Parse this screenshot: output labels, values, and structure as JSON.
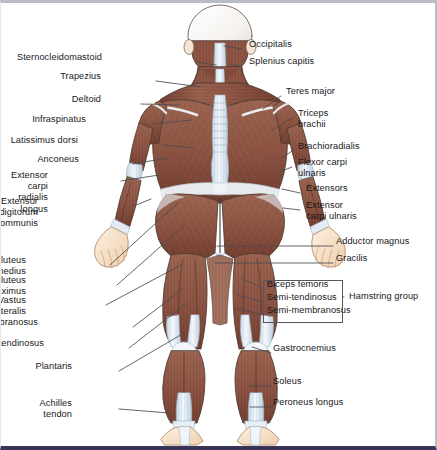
{
  "figure": {
    "view": "posterior",
    "colors": {
      "muscle": "#8b5242",
      "muscle_dark": "#6d3a2d",
      "muscle_light": "#a9705c",
      "tendon": "#dfe9f2",
      "tendon_edge": "#9fb3c6",
      "skin": "#f6ddc3",
      "skin_edge": "#c9a684",
      "skull": "#f7f5f3",
      "outline": "#4a3b33",
      "leader": "#4a4a52",
      "background": "#ffffff",
      "border_top": "#b9bcc6",
      "border_bottom": "#3a3358",
      "text": "#17171a"
    }
  },
  "labels_left": [
    {
      "id": "sternocleidomastoid",
      "text": "Sternocleidomastoid",
      "x": 104,
      "y": 55,
      "lx": 196,
      "ly": 59,
      "tx": 215,
      "ty": 62
    },
    {
      "id": "trapezius",
      "text": "Trapezius",
      "x": 103,
      "y": 74,
      "lx": 155,
      "ly": 78,
      "tx": 200,
      "ty": 84
    },
    {
      "id": "deltoid",
      "text": "Deltoid",
      "x": 103,
      "y": 97,
      "lx": 140,
      "ly": 101,
      "tx": 179,
      "ty": 102
    },
    {
      "id": "infraspinatus",
      "text": "Infraspinatus",
      "x": 88,
      "y": 117,
      "lx": 153,
      "ly": 121,
      "tx": 190,
      "ty": 117
    },
    {
      "id": "latissimus-dorsi",
      "text": "Latissimus dorsi",
      "x": 80,
      "y": 138,
      "lx": 162,
      "ly": 142,
      "tx": 192,
      "ty": 145
    },
    {
      "id": "anconeus",
      "text": "Anconeus",
      "x": 81,
      "y": 157,
      "lx": 132,
      "ly": 161,
      "tx": 166,
      "ty": 155
    },
    {
      "id": "extensor-carpi-radialis-longus",
      "text": "Extensor carpi\nradialis longus",
      "x": 50,
      "y": 173,
      "lx": 120,
      "ly": 178,
      "tx": 158,
      "ty": 172
    },
    {
      "id": "extensor-digitorum-communis",
      "text": "Extensor digitorum\ncommunis",
      "x": 40,
      "y": 199,
      "lx": 133,
      "ly": 203,
      "tx": 150,
      "ty": 196
    },
    {
      "id": "gluteus-medius",
      "text": "Gluteus medius",
      "x": 28,
      "y": 258,
      "lx": 109,
      "ly": 262,
      "tx": 178,
      "ty": 199
    },
    {
      "id": "gluteus-maximus",
      "text": "Gluteus maximus",
      "x": 28,
      "y": 278,
      "lx": 116,
      "ly": 282,
      "tx": 184,
      "ty": 222
    },
    {
      "id": "vastus-lateralis",
      "text": "Vastus lateralis",
      "x": 28,
      "y": 298,
      "lx": 105,
      "ly": 302,
      "tx": 180,
      "ty": 262
    },
    {
      "id": "semimembranosus",
      "text": "Semimembranosus",
      "x": 40,
      "y": 320,
      "lx": 132,
      "ly": 324,
      "tx": 182,
      "ty": 286
    },
    {
      "id": "semitendinosus",
      "text": "Semitendinosus",
      "x": 46,
      "y": 341,
      "lx": 128,
      "ly": 345,
      "tx": 186,
      "ty": 300
    },
    {
      "id": "plantaris",
      "text": "Plantaris",
      "x": 74,
      "y": 364,
      "lx": 118,
      "ly": 368,
      "tx": 183,
      "ty": 330
    },
    {
      "id": "achilles-tendon",
      "text": "Achilles\ntendon",
      "x": 74,
      "y": 401,
      "lx": 118,
      "ly": 406,
      "tx": 168,
      "ty": 410
    }
  ],
  "labels_right": [
    {
      "id": "occipitalis",
      "text": "Occipitalis",
      "x": 248,
      "y": 42,
      "lx": 240,
      "ly": 46,
      "tx": 223,
      "ty": 43
    },
    {
      "id": "splenius-capitis",
      "text": "Splenius capitis",
      "x": 248,
      "y": 59,
      "lx": 240,
      "ly": 63,
      "tx": 229,
      "ty": 61
    },
    {
      "id": "teres-major",
      "text": "Teres major",
      "x": 285,
      "y": 89,
      "lx": 280,
      "ly": 93,
      "tx": 262,
      "ty": 106
    },
    {
      "id": "triceps-brachii",
      "text": "Triceps\nbrachii",
      "x": 297,
      "y": 111,
      "lx": 291,
      "ly": 115,
      "tx": 270,
      "ty": 128
    },
    {
      "id": "brachioradialis",
      "text": "Brachioradialis",
      "x": 297,
      "y": 144,
      "lx": 291,
      "ly": 148,
      "tx": 281,
      "ty": 155
    },
    {
      "id": "flexor-carpi-ulnaris",
      "text": "Flexor carpi\nulnaris",
      "x": 297,
      "y": 160,
      "lx": 291,
      "ly": 164,
      "tx": 276,
      "ty": 170
    },
    {
      "id": "extensors",
      "text": "Extensors",
      "x": 305,
      "y": 186,
      "lx": 299,
      "ly": 190,
      "tx": 281,
      "ty": 186
    },
    {
      "id": "extensor-carpi-ulnaris",
      "text": "Extensor\ncarpi ulnaris",
      "x": 305,
      "y": 203,
      "lx": 299,
      "ly": 207,
      "tx": 282,
      "ty": 205
    },
    {
      "id": "adductor-magnus",
      "text": "Adductor magnus",
      "x": 335,
      "y": 239,
      "lx": 332,
      "ly": 243,
      "tx": 216,
      "ty": 243
    },
    {
      "id": "gracilis",
      "text": "Gracilis",
      "x": 335,
      "y": 256,
      "lx": 332,
      "ly": 260,
      "tx": 214,
      "ty": 260
    },
    {
      "id": "gastrocnemius",
      "text": "Gastrocnemius",
      "x": 272,
      "y": 346,
      "lx": 270,
      "ly": 350,
      "tx": 251,
      "ty": 344
    },
    {
      "id": "soleus",
      "text": "Soleus",
      "x": 272,
      "y": 379,
      "lx": 270,
      "ly": 383,
      "tx": 248,
      "ty": 383
    },
    {
      "id": "peroneus-longus",
      "text": "Peroneus longus",
      "x": 272,
      "y": 400,
      "lx": 270,
      "ly": 404,
      "tx": 249,
      "ty": 404
    }
  ],
  "hamstring_group": {
    "label": "Hamstring group",
    "items": [
      {
        "id": "biceps-femoris",
        "text": "Biceps femoris",
        "x": 266,
        "y": 282,
        "lx": 263,
        "ly": 286,
        "tx": 240,
        "ty": 275
      },
      {
        "id": "semi-tendinosus",
        "text": "Semi-tendinosus",
        "x": 266,
        "y": 295,
        "lx": 263,
        "ly": 299,
        "tx": 236,
        "ty": 292
      },
      {
        "id": "semi-membranosus",
        "text": "Semi-membranosus",
        "x": 266,
        "y": 308,
        "lx": 263,
        "ly": 312,
        "tx": 234,
        "ty": 305
      }
    ],
    "bracket": {
      "x": 262,
      "y": 277,
      "w": 80,
      "h": 43
    },
    "group_label_x": 348,
    "group_label_y": 294
  }
}
